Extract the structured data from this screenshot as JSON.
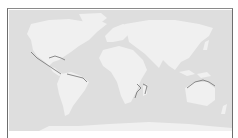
{
  "map": {
    "type": "world-map",
    "projection": "equirectangular",
    "colors": {
      "ocean": "#dedede",
      "land": "#f0f0f0",
      "highlight_coast": "#707070",
      "frame": "#6e6e6e"
    },
    "highlighted_coastlines": [
      "Pacific coast of Mexico and Central America",
      "Caribbean islands",
      "Northern coast of South America",
      "Mozambique channel / Madagascar",
      "Northern Australia and New Guinea"
    ]
  }
}
